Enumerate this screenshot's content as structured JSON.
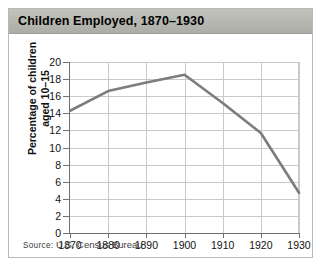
{
  "figure": {
    "title": "Children Employed, 1870–1930",
    "source_prefix": "Source:",
    "source_text": " U.S. Census Bureau"
  },
  "colors": {
    "line": "#7c7c7c",
    "grid": "#c9c9c9",
    "axis": "#6f6f6f",
    "title_bar": "#b5b5af"
  },
  "chart_data": {
    "type": "line",
    "title": "Children Employed, 1870–1930",
    "xlabel": "",
    "ylabel": "Percentage of children aged 10–15",
    "ylabel_lines": [
      "Percentage of children",
      "aged 10–15"
    ],
    "x": [
      1870,
      1880,
      1890,
      1900,
      1910,
      1920,
      1930
    ],
    "values": [
      14.3,
      16.6,
      17.6,
      18.5,
      15.2,
      11.7,
      4.7
    ],
    "series": [
      {
        "name": "Percentage of children aged 10–15 employed",
        "values": [
          14.3,
          16.6,
          17.6,
          18.5,
          15.2,
          11.7,
          4.7
        ]
      }
    ],
    "xticks": [
      "1870",
      "1880",
      "1890",
      "1900",
      "1910",
      "1920",
      "1930"
    ],
    "yticks": [
      "0",
      "2",
      "4",
      "6",
      "8",
      "10",
      "12",
      "14",
      "16",
      "18",
      "20"
    ],
    "xlim": [
      1870,
      1930
    ],
    "ylim": [
      0,
      20
    ],
    "grid": true,
    "legend": false
  }
}
